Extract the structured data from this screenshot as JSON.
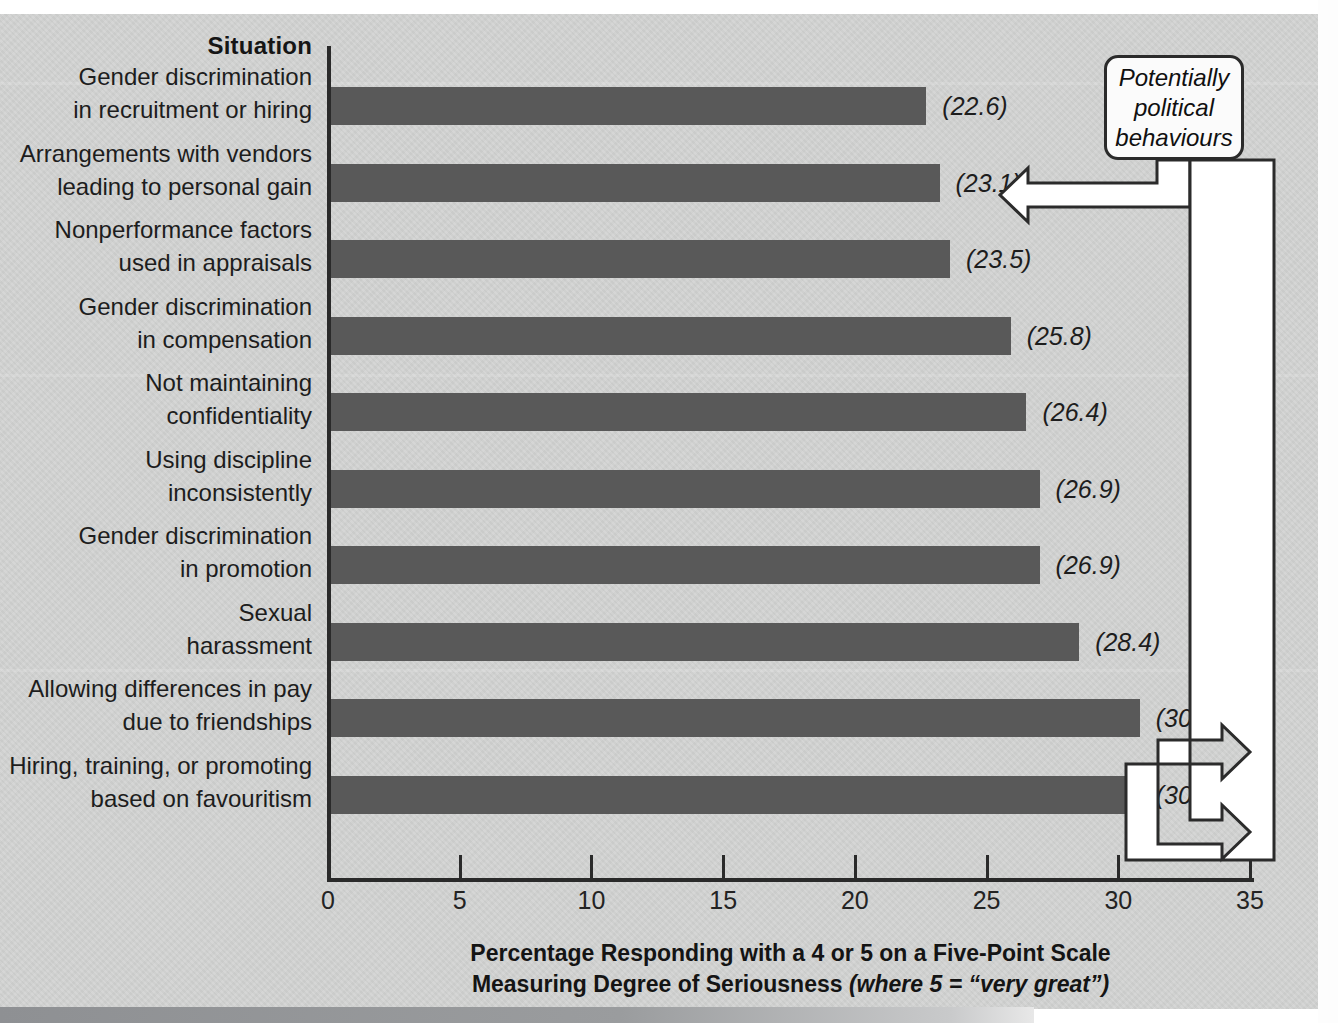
{
  "figure": {
    "column_header": "Situation",
    "axis_title_line1": "Percentage Responding with a 4 or 5 on a Five-Point Scale",
    "axis_title_line2_bold": "Measuring Degree of Seriousness",
    "axis_title_line2_italic": "(where 5 = “very great”)",
    "callout_label": "Potentially\npolitical\nbehaviours",
    "callout_line1": "Potentially",
    "callout_line2": "political",
    "callout_line3": "behaviours",
    "bar_color": "#595959",
    "panel_color": "#d3d4d3",
    "axis_color": "#2a2a2a"
  },
  "chart_data": {
    "type": "bar",
    "orientation": "horizontal",
    "title": "",
    "xlabel": "Percentage Responding with a 4 or 5 on a Five-Point Scale Measuring Degree of Seriousness (where 5 = “very great”)",
    "ylabel": "Situation",
    "xlim": [
      0,
      35
    ],
    "xticks": [
      0,
      5,
      10,
      15,
      20,
      25,
      30,
      35
    ],
    "grid": false,
    "legend": "none",
    "value_label_format": "(v)",
    "annotations": [
      {
        "text": "Potentially political behaviours",
        "points_to": [
          "Arrangements with vendors leading to personal gain",
          "Allowing differences in pay due to friendships",
          "Hiring, training, or promoting based on favouritism"
        ]
      }
    ],
    "categories": [
      "Gender discrimination in recruitment or hiring",
      "Arrangements with vendors leading to personal gain",
      "Nonperformance factors used in appraisals",
      "Gender discrimination in compensation",
      "Not maintaining confidentiality",
      "Using discipline inconsistently",
      "Gender discrimination in promotion",
      "Sexual harassment",
      "Allowing differences in pay due to friendships",
      "Hiring, training, or promoting based on favouritism"
    ],
    "values": [
      22.6,
      23.1,
      23.5,
      25.8,
      26.4,
      26.9,
      26.9,
      28.4,
      30.7,
      30.7
    ],
    "bars": [
      {
        "line1": "Gender discrimination",
        "line2": "in recruitment or hiring",
        "value": 22.6,
        "label": "(22.6)",
        "flagged": false
      },
      {
        "line1": "Arrangements with vendors",
        "line2": "leading to personal gain",
        "value": 23.1,
        "label": "(23.1)",
        "flagged": true
      },
      {
        "line1": "Nonperformance factors",
        "line2": "used in appraisals",
        "value": 23.5,
        "label": "(23.5)",
        "flagged": false
      },
      {
        "line1": "Gender discrimination",
        "line2": "in compensation",
        "value": 25.8,
        "label": "(25.8)",
        "flagged": false
      },
      {
        "line1": "Not maintaining",
        "line2": "confidentiality",
        "value": 26.4,
        "label": "(26.4)",
        "flagged": false
      },
      {
        "line1": "Using discipline",
        "line2": "inconsistently",
        "value": 26.9,
        "label": "(26.9)",
        "flagged": false
      },
      {
        "line1": "Gender discrimination",
        "line2": "in promotion",
        "value": 26.9,
        "label": "(26.9)",
        "flagged": false
      },
      {
        "line1": "Sexual",
        "line2": "harassment",
        "value": 28.4,
        "label": "(28.4)",
        "flagged": false
      },
      {
        "line1": "Allowing differences in pay",
        "line2": "due to friendships",
        "value": 30.7,
        "label": "(30.7)",
        "flagged": true
      },
      {
        "line1": "Hiring, training, or promoting",
        "line2": "based on favouritism",
        "value": 30.7,
        "label": "(30.7)",
        "flagged": true
      }
    ]
  }
}
